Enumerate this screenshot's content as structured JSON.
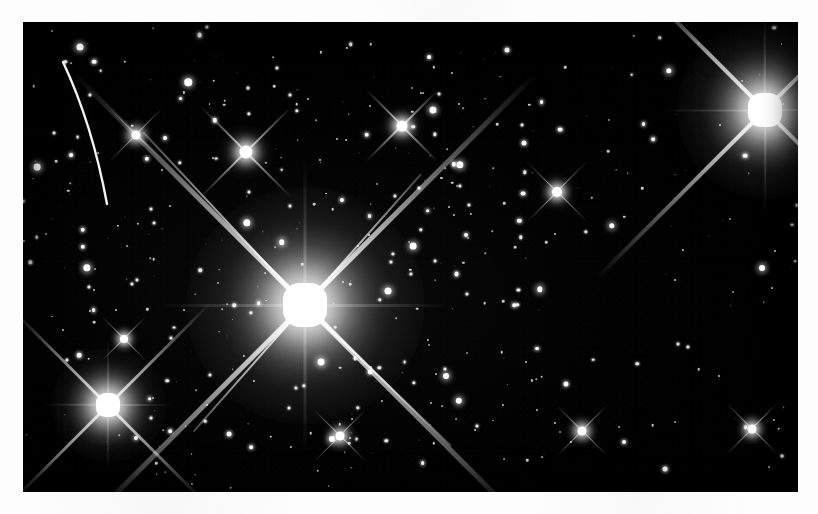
{
  "page": {
    "background_color": "#fdfdfd",
    "width": 818,
    "height": 514,
    "caption": ""
  },
  "photo": {
    "title": "",
    "type": "astronomical-star-field",
    "sky_color": "#000000",
    "star_color": "#ffffff",
    "frame": {
      "x": 23,
      "y": 22,
      "width": 775,
      "height": 470
    },
    "description": "Dense open star cluster field with several overexposed bright stars showing four-point diffraction spikes and a curved satellite trail in the upper left"
  },
  "chart_data": {
    "type": "scatter",
    "xlabel": "",
    "ylabel": "",
    "xlim": [
      0,
      775
    ],
    "ylim": [
      0,
      470
    ],
    "grid": false,
    "legend": "none",
    "annotations": [
      {
        "name": "satellite-trail",
        "x1": 40,
        "y1": 40,
        "x2": 84,
        "y2": 182
      },
      {
        "name": "primary-diffraction-spike-nw",
        "x1": 120,
        "y1": 110,
        "x2": 282,
        "y2": 283
      },
      {
        "name": "primary-diffraction-spike-ne",
        "x1": 398,
        "y1": 152,
        "x2": 282,
        "y2": 283
      },
      {
        "name": "primary-diffraction-spike-se",
        "x1": 282,
        "y1": 283,
        "x2": 428,
        "y2": 424
      },
      {
        "name": "primary-diffraction-spike-sw",
        "x1": 282,
        "y1": 283,
        "x2": 170,
        "y2": 410
      }
    ],
    "bright_stars": [
      {
        "label": "A",
        "x": 282,
        "y": 283,
        "magnitude_rel": 1.0,
        "core_px": 44,
        "spikes": true
      },
      {
        "label": "B",
        "x": 742,
        "y": 88,
        "magnitude_rel": 0.92,
        "core_px": 34,
        "spikes": true
      },
      {
        "label": "C",
        "x": 85,
        "y": 383,
        "magnitude_rel": 0.74,
        "core_px": 24,
        "spikes": true
      },
      {
        "label": "D",
        "x": 223,
        "y": 130,
        "magnitude_rel": 0.52,
        "core_px": 13,
        "spikes": true
      },
      {
        "label": "E",
        "x": 379,
        "y": 104,
        "magnitude_rel": 0.45,
        "core_px": 11,
        "spikes": true
      },
      {
        "label": "F",
        "x": 534,
        "y": 170,
        "magnitude_rel": 0.4,
        "core_px": 10,
        "spikes": true
      },
      {
        "label": "G",
        "x": 113,
        "y": 113,
        "magnitude_rel": 0.38,
        "core_px": 9,
        "spikes": true
      },
      {
        "label": "H",
        "x": 317,
        "y": 414,
        "magnitude_rel": 0.36,
        "core_px": 9,
        "spikes": true
      },
      {
        "label": "I",
        "x": 559,
        "y": 409,
        "magnitude_rel": 0.34,
        "core_px": 9,
        "spikes": true
      },
      {
        "label": "J",
        "x": 729,
        "y": 407,
        "magnitude_rel": 0.34,
        "core_px": 9,
        "spikes": true
      },
      {
        "label": "K",
        "x": 101,
        "y": 317,
        "magnitude_rel": 0.33,
        "core_px": 8,
        "spikes": true
      }
    ],
    "star_count_visible": 430
  },
  "accessibility": {
    "alt_text": "Black and white photograph of a dense star field containing several very bright overexposed stars with cross-shaped diffraction spikes and a curved bright streak near the upper left corner."
  }
}
